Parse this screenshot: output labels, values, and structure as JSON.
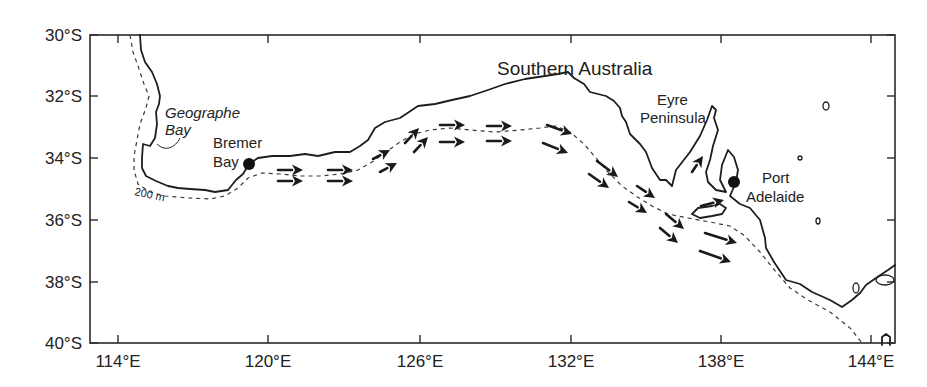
{
  "map": {
    "title": "Southern Australia",
    "frame": {
      "left": 90,
      "top": 35,
      "right": 895,
      "bottom": 343
    },
    "colors": {
      "line": "#1e1e1e",
      "background": "#ffffff"
    },
    "lat_ticks": [
      {
        "label": "30°S",
        "y": 35
      },
      {
        "label": "32°S",
        "y": 96
      },
      {
        "label": "34°S",
        "y": 158
      },
      {
        "label": "36°S",
        "y": 220
      },
      {
        "label": "38°S",
        "y": 282
      },
      {
        "label": "40°S",
        "y": 343
      }
    ],
    "lon_ticks": [
      {
        "label": "114°E",
        "x": 118
      },
      {
        "label": "120°E",
        "x": 268
      },
      {
        "label": "126°E",
        "x": 420
      },
      {
        "label": "132°E",
        "x": 571
      },
      {
        "label": "138°E",
        "x": 721
      },
      {
        "label": "144°E",
        "x": 871
      }
    ],
    "labels": {
      "geographe_line1": "Geographe",
      "geographe_line2": "Bay",
      "bremer_line1": "Bremer",
      "bremer_line2": "Bay",
      "eyre_line1": "Eyre",
      "eyre_line2": "Peninsula",
      "port_line1": "Port",
      "port_line2": "Adelaide",
      "isobath": "200 m"
    },
    "points": [
      {
        "name": "Bremer Bay",
        "x": 249,
        "y": 164
      },
      {
        "name": "Port Adelaide",
        "x": 734,
        "y": 182
      }
    ],
    "current_arrows": [
      {
        "x1": 278,
        "y1": 170,
        "x2": 303,
        "y2": 170
      },
      {
        "x1": 278,
        "y1": 181,
        "x2": 303,
        "y2": 181
      },
      {
        "x1": 328,
        "y1": 170,
        "x2": 353,
        "y2": 170
      },
      {
        "x1": 328,
        "y1": 181,
        "x2": 353,
        "y2": 181
      },
      {
        "x1": 373,
        "y1": 159,
        "x2": 390,
        "y2": 150
      },
      {
        "x1": 380,
        "y1": 172,
        "x2": 397,
        "y2": 163
      },
      {
        "x1": 405,
        "y1": 143,
        "x2": 419,
        "y2": 128
      },
      {
        "x1": 414,
        "y1": 152,
        "x2": 428,
        "y2": 137
      },
      {
        "x1": 440,
        "y1": 125,
        "x2": 465,
        "y2": 125
      },
      {
        "x1": 440,
        "y1": 142,
        "x2": 465,
        "y2": 142
      },
      {
        "x1": 487,
        "y1": 126,
        "x2": 512,
        "y2": 126
      },
      {
        "x1": 487,
        "y1": 141,
        "x2": 512,
        "y2": 141
      },
      {
        "x1": 547,
        "y1": 125,
        "x2": 572,
        "y2": 134
      },
      {
        "x1": 543,
        "y1": 143,
        "x2": 568,
        "y2": 153
      },
      {
        "x1": 597,
        "y1": 161,
        "x2": 618,
        "y2": 177
      },
      {
        "x1": 589,
        "y1": 174,
        "x2": 609,
        "y2": 188
      },
      {
        "x1": 637,
        "y1": 186,
        "x2": 655,
        "y2": 198
      },
      {
        "x1": 629,
        "y1": 202,
        "x2": 647,
        "y2": 213
      },
      {
        "x1": 666,
        "y1": 214,
        "x2": 684,
        "y2": 229
      },
      {
        "x1": 660,
        "y1": 228,
        "x2": 678,
        "y2": 243
      },
      {
        "x1": 705,
        "y1": 233,
        "x2": 737,
        "y2": 243
      },
      {
        "x1": 700,
        "y1": 251,
        "x2": 731,
        "y2": 262
      },
      {
        "x1": 692,
        "y1": 172,
        "x2": 703,
        "y2": 156
      },
      {
        "x1": 701,
        "y1": 206,
        "x2": 724,
        "y2": 200
      }
    ],
    "coastlines": {
      "mainland": "140,35 141,50 145,62 152,72 157,84 160,96 159,104 156,112 157,124 155,138 150,146 143,144 142,158 142,168 146,176 156,181 168,186 178,188 190,189 205,190 215,192 228,190 236,180 243,174 249,164 258,158 272,156 290,156 305,154 318,156 335,152 350,152 360,146 368,140 375,128 385,122 400,118 418,106 435,104 452,100 470,96 488,90 505,84 525,79 545,76 558,74 568,72 574,78 584,84 590,92 598,94 606,96 614,101 620,108 622,116 626,122 630,134 640,144 646,152 652,168 660,180 666,180 672,186 676,170 690,152 700,136 707,120 712,106 716,110 714,118 718,130 713,146 710,160 706,172 708,182 716,190 726,192 720,180 722,165 728,150 734,157 738,170 736,182 730,196 740,204 750,208 760,220 765,238 766,248 774,262 786,280 800,284 812,292 830,300 842,307 852,300 860,293 866,285 876,278 888,270 895,265",
      "kangaroo_island": "692,214 698,208 712,206 720,204 726,208 722,214 712,216 700,218 692,214",
      "tasmania_top": "882,345 882,337 886,334 890,337 890,345"
    },
    "islands": [
      {
        "cx": 826,
        "cy": 106,
        "rx": 3,
        "ry": 4
      },
      {
        "cx": 800,
        "cy": 158,
        "rx": 2,
        "ry": 2
      },
      {
        "cx": 818,
        "cy": 221,
        "rx": 2,
        "ry": 3
      },
      {
        "cx": 856,
        "cy": 288,
        "rx": 3,
        "ry": 5
      },
      {
        "cx": 885,
        "cy": 280,
        "rx": 9,
        "ry": 5
      }
    ],
    "isobath_path": "130,35 133,52 138,66 144,84 149,96 146,108 140,124 137,140 134,156 134,170 138,184 150,192 165,196 190,198 210,199 225,196 238,188 248,178 262,173 280,174 300,176 320,176 340,174 358,170 372,162 386,152 400,142 414,134 430,130 450,128 470,130 495,132 520,130 540,128 556,126 570,132 584,144 596,158 608,172 622,186 636,196 652,206 668,214 688,218 710,222 730,226 745,236 760,252 776,272 790,288 808,300 830,312 850,328 862,343"
  }
}
